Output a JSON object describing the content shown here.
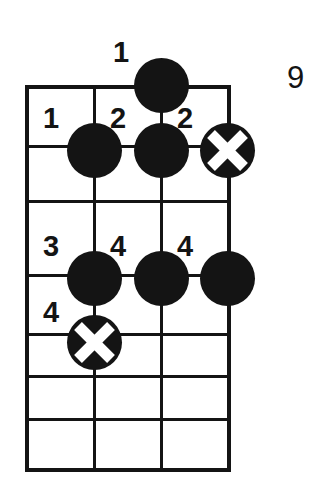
{
  "diagram": {
    "type": "guitar-chord-diagram",
    "position_marker": "9",
    "strings": 4,
    "frets": 7,
    "colors": {
      "ink": "#141414",
      "paper": "#ffffff"
    },
    "grid": {
      "left": 27,
      "right": 227,
      "top": 86,
      "bottom": 472,
      "string_x": [
        27,
        94,
        161,
        227
      ],
      "fret_y": [
        86,
        141,
        196,
        251,
        306,
        362,
        417,
        472
      ]
    },
    "markers": [
      {
        "id": "m1",
        "kind": "filled",
        "string": 3,
        "fret_y": 86,
        "x": 161,
        "y": 86,
        "finger": "1",
        "label_x": 113,
        "label_y": 41
      },
      {
        "id": "m2",
        "kind": "filled",
        "string": 2,
        "fret_y": 150,
        "x": 94,
        "y": 150,
        "finger": "1",
        "label_x": 43,
        "label_y": 107
      },
      {
        "id": "m3",
        "kind": "filled",
        "string": 3,
        "fret_y": 150,
        "x": 161,
        "y": 150,
        "finger": "2",
        "label_x": 110,
        "label_y": 107
      },
      {
        "id": "m4",
        "kind": "muted-x",
        "string": 4,
        "fret_y": 150,
        "x": 227,
        "y": 150,
        "finger": "2",
        "label_x": 177,
        "label_y": 107
      },
      {
        "id": "m5",
        "kind": "filled",
        "string": 2,
        "fret_y": 278,
        "x": 94,
        "y": 278,
        "finger": "3",
        "label_x": 43,
        "label_y": 234
      },
      {
        "id": "m6",
        "kind": "filled",
        "string": 3,
        "fret_y": 278,
        "x": 161,
        "y": 278,
        "finger": "4",
        "label_x": 110,
        "label_y": 234
      },
      {
        "id": "m7",
        "kind": "filled",
        "string": 4,
        "fret_y": 278,
        "x": 227,
        "y": 278,
        "finger": "4",
        "label_x": 177,
        "label_y": 234
      },
      {
        "id": "m8",
        "kind": "muted-x",
        "string": 2,
        "fret_y": 342,
        "x": 94,
        "y": 342,
        "finger": "4",
        "label_x": 43,
        "label_y": 300
      }
    ],
    "finger_numbers": [
      "1",
      "1",
      "2",
      "2",
      "3",
      "4",
      "4",
      "4"
    ],
    "position_label_x": 288,
    "position_label_y": 64
  }
}
